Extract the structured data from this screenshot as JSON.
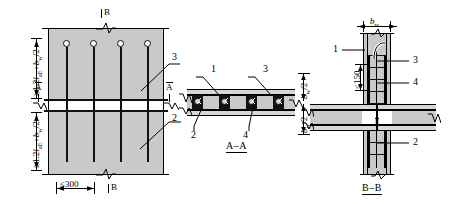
{
  "drawing": {
    "title_hidden": "",
    "colors": {
      "concrete_fill": "#c9c9c9",
      "concrete_fill_light": "#d6d6d6",
      "line": "#000000",
      "rebar": "#111111",
      "background": "#ffffff"
    }
  },
  "elevation": {
    "name": "main-elevation-view",
    "section_marks": {
      "top_b": "B",
      "bottom_b": "B",
      "left_a": "A",
      "right_a": "A"
    },
    "dimensions": {
      "upper_anchorage": "≥1.2laE+bw/2",
      "lower_anchorage": "≥1.2laE+bw/2",
      "spacing": "≤300"
    },
    "callouts": [
      {
        "id": "3",
        "label": "3"
      },
      {
        "id": "2",
        "label": "2"
      }
    ],
    "bar_count": 4
  },
  "section_aa": {
    "name": "section-a-a",
    "caption": "A–A",
    "callouts": [
      {
        "id": "1",
        "label": "1"
      },
      {
        "id": "3",
        "label": "3"
      },
      {
        "id": "2",
        "label": "2"
      },
      {
        "id": "4",
        "label": "4"
      }
    ],
    "dimensions": {
      "upper_half_width": "bw/2",
      "lower_half_width": "bw/2"
    },
    "rebar_positions": 4
  },
  "section_bb": {
    "name": "section-b-b",
    "caption": "B–B",
    "callouts": [
      {
        "id": "1",
        "label": "1"
      },
      {
        "id": "3",
        "label": "3"
      },
      {
        "id": "4",
        "label": "4"
      },
      {
        "id": "2",
        "label": "2"
      }
    ],
    "dimensions": {
      "wall_thickness": "bw",
      "stirrup_spacing": "≤150"
    }
  },
  "formula_parts": {
    "ge": "≥",
    "factor": "1.2",
    "l_symbol": "l",
    "l_sub": "aE",
    "plus": "+",
    "b_symbol": "b",
    "b_sub": "w",
    "half": "/2",
    "le": "≤",
    "three_hundred": "300",
    "one_fifty": "150"
  }
}
